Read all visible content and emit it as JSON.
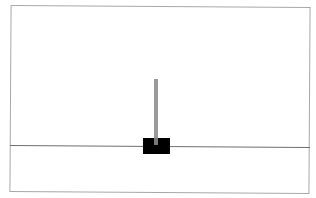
{
  "game": {
    "name": "cartpole",
    "colors": {
      "background": "#ffffff",
      "frame_border": "#a8a8a8",
      "track": "#6e6e6e",
      "cart": "#000000",
      "pole": "#9a9a9a"
    },
    "elements": {
      "cart": {
        "x": 143,
        "y": 138,
        "width": 27,
        "height": 16
      },
      "pole": {
        "x": 154,
        "y": 79,
        "width": 4,
        "height": 66,
        "angle_deg": 0
      },
      "track": {
        "y": 145
      }
    }
  }
}
